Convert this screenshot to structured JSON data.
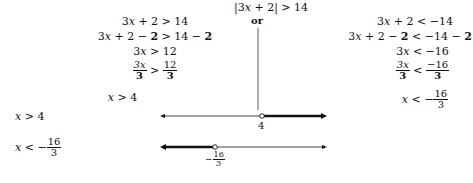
{
  "title": {
    "abs": "|3",
    "var": "x",
    "rest": " + 2| > 14"
  },
  "connector": "or",
  "left_steps": [
    {
      "a": "3",
      "x": "x",
      "b": " + 2 > 14"
    },
    {
      "a": "3",
      "x": "x",
      "b": " + 2 − ",
      "bold": "2",
      "c": " > 14 − ",
      "bold2": "2"
    },
    {
      "a": "3",
      "x": "x",
      "b": " > 12"
    },
    {
      "frac_num": "3x",
      "frac_den": "3",
      "op": " > ",
      "frac2_num": "12",
      "frac2_den": "3"
    },
    {
      "x": "x",
      "b": " > 4"
    }
  ],
  "right_steps": [
    {
      "a": "3",
      "x": "x",
      "b": " + 2 < −14"
    },
    {
      "a": "3",
      "x": "x",
      "b": " + 2 − ",
      "bold": "2",
      "c": " < −14 − ",
      "bold2": "2"
    },
    {
      "a": "3",
      "x": "x",
      "b": " < −16"
    },
    {
      "frac_num": "3x",
      "frac_den": "3",
      "op": " < ",
      "frac2_num": "−16",
      "frac2_den": "3"
    },
    {
      "x": "x",
      "op": " < −",
      "frac_num": "16",
      "frac_den": "3"
    }
  ],
  "number_lines": [
    {
      "label_x": "x",
      "label_op": " > 4",
      "point_label": "4",
      "shaded": "right"
    },
    {
      "label_x": "x",
      "label_op": " < −",
      "label_num": "16",
      "label_den": "3",
      "point_sign": "−",
      "point_num": "16",
      "point_den": "3",
      "shaded": "left"
    }
  ]
}
